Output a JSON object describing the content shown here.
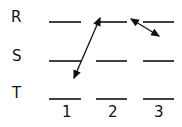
{
  "diagram": {
    "rows": [
      {
        "label": "R",
        "y": 22
      },
      {
        "label": "S",
        "y": 61
      },
      {
        "label": "T",
        "y": 99
      }
    ],
    "columns": [
      {
        "label": "1",
        "x1": 49,
        "x2": 81
      },
      {
        "label": "2",
        "x1": 96,
        "x2": 127
      },
      {
        "label": "3",
        "x1": 143,
        "x2": 174
      }
    ],
    "arrows": [
      {
        "from": "1-T",
        "to": "2-R",
        "double_headed": true
      },
      {
        "from": "2-R/3-R",
        "to": "3-between-R-S",
        "double_headed": true
      }
    ],
    "colors": {
      "line": "#111111",
      "background": "#ffffff"
    }
  }
}
